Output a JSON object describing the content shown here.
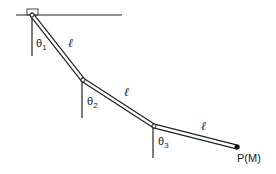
{
  "diagram": {
    "links": [
      {
        "length_label": "ℓ",
        "angle_label": "θ",
        "angle_index": "1"
      },
      {
        "length_label": "ℓ",
        "angle_label": "θ",
        "angle_index": "2"
      },
      {
        "length_label": "ℓ",
        "angle_label": "θ",
        "angle_index": "3"
      }
    ],
    "end_point_label": "P(M)",
    "colors": {
      "line": "#222222",
      "background": "#ffffff"
    }
  }
}
